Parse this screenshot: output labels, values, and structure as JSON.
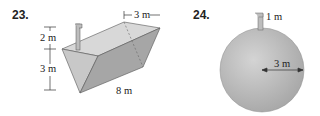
{
  "figures": [
    {
      "number": "23.",
      "shape": "triangular-prism-tank",
      "labels": {
        "spout_height": "2 m",
        "depth": "3 m",
        "top_width": "3 m",
        "length": "8 m"
      }
    },
    {
      "number": "24.",
      "shape": "spherical-tank",
      "labels": {
        "spout_height": "1 m",
        "radius": "3 m"
      }
    }
  ],
  "colors": {
    "tank_light": "#d2d2d2",
    "tank_mid": "#b4b4b4",
    "tank_dark": "#9a9a9a",
    "line": "#333333"
  }
}
